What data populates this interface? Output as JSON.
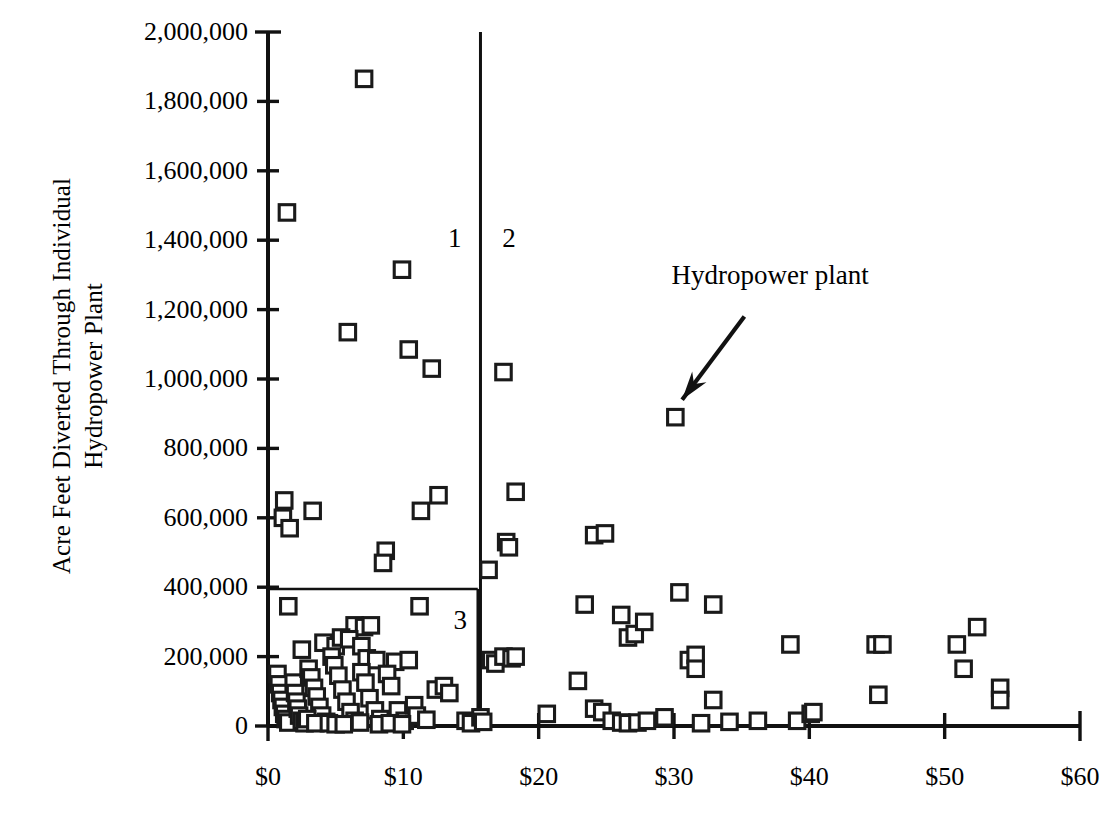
{
  "chart_data": {
    "type": "scatter",
    "title": "",
    "subtitle": "",
    "xlabel": "",
    "ylabel": "Acre Feet Diverted Through Individual\nHydropower Plant",
    "xlim": [
      0,
      60
    ],
    "ylim": [
      0,
      2000000
    ],
    "grid": false,
    "legend_position": "none",
    "xtick_labels": [
      "$0",
      "$10",
      "$20",
      "$30",
      "$40",
      "$50",
      "$60"
    ],
    "xtick_values": [
      0,
      10,
      20,
      30,
      40,
      50,
      60
    ],
    "ytick_labels": [
      "0",
      "200,000",
      "400,000",
      "600,000",
      "800,000",
      "1,000,000",
      "1,200,000",
      "1,400,000",
      "1,600,000",
      "1,800,000",
      "2,000,000"
    ],
    "ytick_values": [
      0,
      200000,
      400000,
      600000,
      800000,
      1000000,
      1200000,
      1400000,
      1600000,
      1800000,
      2000000
    ],
    "marker": "open-square",
    "marker_color": "#1a1a1a",
    "marker_fill": "#ffffff",
    "series": [
      {
        "name": "Hydropower plant",
        "points": [
          [
            1.4,
            1480000
          ],
          [
            7.1,
            1865000
          ],
          [
            9.9,
            1315000
          ],
          [
            5.9,
            1135000
          ],
          [
            10.4,
            1085000
          ],
          [
            12.1,
            1030000
          ],
          [
            17.4,
            1020000
          ],
          [
            30.1,
            890000
          ],
          [
            1.2,
            650000
          ],
          [
            1.1,
            600000
          ],
          [
            1.6,
            570000
          ],
          [
            3.3,
            620000
          ],
          [
            11.3,
            620000
          ],
          [
            12.6,
            665000
          ],
          [
            18.3,
            675000
          ],
          [
            8.7,
            505000
          ],
          [
            8.5,
            470000
          ],
          [
            16.3,
            450000
          ],
          [
            17.6,
            530000
          ],
          [
            17.8,
            515000
          ],
          [
            24.1,
            550000
          ],
          [
            24.9,
            555000
          ],
          [
            1.5,
            345000
          ],
          [
            11.2,
            345000
          ],
          [
            6.4,
            290000
          ],
          [
            7.1,
            285000
          ],
          [
            7.6,
            290000
          ],
          [
            23.4,
            350000
          ],
          [
            26.1,
            320000
          ],
          [
            26.6,
            255000
          ],
          [
            27.1,
            265000
          ],
          [
            27.8,
            300000
          ],
          [
            30.4,
            385000
          ],
          [
            32.9,
            350000
          ],
          [
            2.5,
            220000
          ],
          [
            4.1,
            240000
          ],
          [
            5.0,
            230000
          ],
          [
            5.4,
            255000
          ],
          [
            6.0,
            250000
          ],
          [
            6.9,
            230000
          ],
          [
            7.3,
            195000
          ],
          [
            8.0,
            190000
          ],
          [
            9.4,
            185000
          ],
          [
            10.4,
            190000
          ],
          [
            12.4,
            105000
          ],
          [
            13.0,
            115000
          ],
          [
            13.4,
            95000
          ],
          [
            14.6,
            15000
          ],
          [
            16.5,
            190000
          ],
          [
            16.8,
            180000
          ],
          [
            17.4,
            200000
          ],
          [
            18.0,
            195000
          ],
          [
            18.3,
            200000
          ],
          [
            20.6,
            35000
          ],
          [
            22.9,
            130000
          ],
          [
            24.1,
            50000
          ],
          [
            24.7,
            40000
          ],
          [
            25.4,
            15000
          ],
          [
            26.1,
            10000
          ],
          [
            26.6,
            8000
          ],
          [
            27.3,
            10000
          ],
          [
            28.0,
            15000
          ],
          [
            29.3,
            25000
          ],
          [
            31.1,
            190000
          ],
          [
            31.6,
            205000
          ],
          [
            31.6,
            165000
          ],
          [
            32.0,
            8000
          ],
          [
            32.9,
            75000
          ],
          [
            34.1,
            12000
          ],
          [
            36.2,
            15000
          ],
          [
            38.6,
            235000
          ],
          [
            39.1,
            15000
          ],
          [
            40.1,
            35000
          ],
          [
            40.3,
            40000
          ],
          [
            44.9,
            235000
          ],
          [
            45.4,
            235000
          ],
          [
            45.1,
            90000
          ],
          [
            50.9,
            235000
          ],
          [
            51.4,
            165000
          ],
          [
            52.4,
            285000
          ],
          [
            54.1,
            110000
          ],
          [
            54.1,
            75000
          ],
          [
            0.7,
            150000
          ],
          [
            0.8,
            120000
          ],
          [
            0.9,
            95000
          ],
          [
            1.0,
            75000
          ],
          [
            1.1,
            55000
          ],
          [
            1.2,
            35000
          ],
          [
            1.3,
            20000
          ],
          [
            1.5,
            10000
          ],
          [
            1.9,
            125000
          ],
          [
            2.0,
            95000
          ],
          [
            2.1,
            70000
          ],
          [
            2.2,
            50000
          ],
          [
            2.3,
            30000
          ],
          [
            2.5,
            15000
          ],
          [
            2.7,
            8000
          ],
          [
            3.0,
            165000
          ],
          [
            3.2,
            140000
          ],
          [
            3.4,
            110000
          ],
          [
            3.6,
            85000
          ],
          [
            3.8,
            55000
          ],
          [
            4.0,
            30000
          ],
          [
            4.3,
            12000
          ],
          [
            4.7,
            200000
          ],
          [
            4.9,
            175000
          ],
          [
            5.2,
            145000
          ],
          [
            5.5,
            105000
          ],
          [
            5.8,
            70000
          ],
          [
            6.1,
            40000
          ],
          [
            6.4,
            15000
          ],
          [
            6.9,
            155000
          ],
          [
            7.2,
            125000
          ],
          [
            7.5,
            80000
          ],
          [
            7.9,
            45000
          ],
          [
            8.3,
            20000
          ],
          [
            8.8,
            150000
          ],
          [
            9.1,
            115000
          ],
          [
            9.6,
            45000
          ],
          [
            10.1,
            15000
          ],
          [
            10.8,
            60000
          ],
          [
            11.0,
            30000
          ],
          [
            11.7,
            18000
          ],
          [
            2.9,
            20000
          ],
          [
            3.5,
            8000
          ],
          [
            4.5,
            8000
          ],
          [
            5.0,
            5000
          ],
          [
            5.6,
            5000
          ],
          [
            6.8,
            10000
          ],
          [
            8.2,
            5000
          ],
          [
            9.0,
            8000
          ],
          [
            9.9,
            5000
          ],
          [
            15.0,
            8000
          ],
          [
            15.7,
            25000
          ],
          [
            15.9,
            12000
          ]
        ]
      }
    ],
    "annotations": [
      {
        "name": "region-1",
        "text": "1",
        "x": 13.8,
        "y": 1405000
      },
      {
        "name": "region-2",
        "text": "2",
        "x": 17.8,
        "y": 1405000
      },
      {
        "name": "region-3",
        "text": "3",
        "x": 14.2,
        "y": 305000
      },
      {
        "name": "callout",
        "text": "Hydropower plant",
        "x": 37.1,
        "y": 1300000
      }
    ],
    "shapes": [
      {
        "name": "region-divider",
        "type": "vline",
        "x": 15.7
      },
      {
        "name": "region-3-box",
        "type": "rect",
        "x0": 0,
        "y0": 0,
        "x1": 15.5,
        "y1": 395000
      },
      {
        "name": "callout-arrow",
        "type": "arrow",
        "from_x": 35.2,
        "from_y": 1180000,
        "to_x": 30.6,
        "to_y": 940000
      }
    ]
  }
}
